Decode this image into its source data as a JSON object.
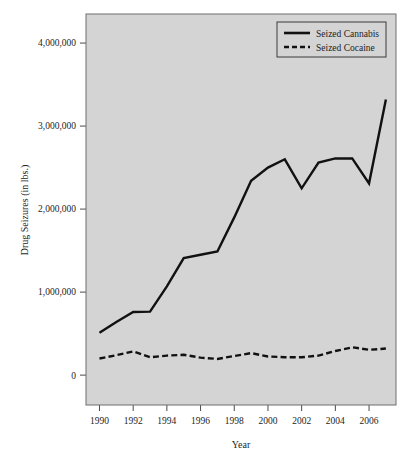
{
  "chart_data": {
    "type": "line",
    "title": "",
    "xlabel": "Year",
    "ylabel": "Drug Seizures (in lbs.)",
    "xlim": [
      1989.2,
      2007.6
    ],
    "ylim": [
      -360000,
      4350000
    ],
    "grid": false,
    "legend_position": "top-right",
    "x": [
      1990,
      1991,
      1992,
      1993,
      1994,
      1995,
      1996,
      1997,
      1998,
      1999,
      2000,
      2001,
      2002,
      2003,
      2004,
      2005,
      2006,
      2007
    ],
    "xticks": [
      1990,
      1992,
      1994,
      1996,
      1998,
      2000,
      2002,
      2004,
      2006
    ],
    "xtick_labels": [
      "1990",
      "1992",
      "1994",
      "1996",
      "1998",
      "2000",
      "2002",
      "2004",
      "2006"
    ],
    "yticks": [
      0,
      1000000,
      2000000,
      3000000,
      4000000
    ],
    "ytick_labels": [
      "0",
      "1,000,000",
      "2,000,000",
      "3,000,000",
      "4,000,000"
    ],
    "series": [
      {
        "name": "Seized Cannabis",
        "style": "solid",
        "color": "#111111",
        "values": [
          510000,
          640000,
          760000,
          765000,
          1070000,
          1410000,
          1450000,
          1490000,
          1900000,
          2340000,
          2500000,
          2600000,
          2250000,
          2560000,
          2610000,
          2610000,
          2310000,
          3320000
        ]
      },
      {
        "name": "Seized Cocaine",
        "style": "dashed",
        "color": "#111111",
        "values": [
          200000,
          240000,
          285000,
          215000,
          235000,
          245000,
          210000,
          195000,
          230000,
          265000,
          225000,
          215000,
          215000,
          235000,
          290000,
          335000,
          305000,
          320000
        ]
      }
    ]
  },
  "legend": {
    "entries": [
      {
        "label": "Seized Cannabis",
        "style": "solid"
      },
      {
        "label": "Seized Cocaine",
        "style": "dashed"
      }
    ]
  },
  "axes": {
    "y_axis_title": "Drug Seizures (in lbs.)",
    "x_axis_title": "Year"
  }
}
